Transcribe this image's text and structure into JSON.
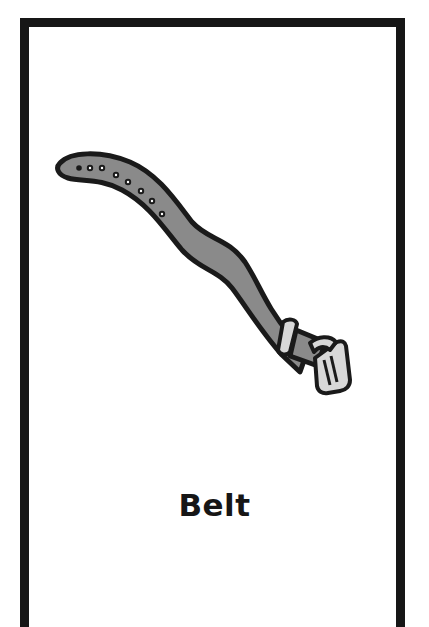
{
  "card": {
    "label": "Belt",
    "illustration": "belt-icon"
  },
  "colors": {
    "frame": "#161616",
    "belt_strap": "#8a8a8a",
    "belt_outline": "#1a1a1a",
    "buckle": "#d8d8d8",
    "background": "#ffffff"
  }
}
